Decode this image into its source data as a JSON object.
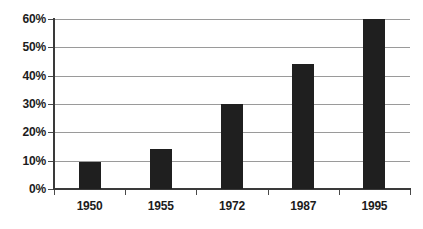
{
  "chart_data": {
    "type": "bar",
    "title": "",
    "xlabel": "",
    "ylabel": "",
    "categories": [
      "1950",
      "1955",
      "1972",
      "1987",
      "1995"
    ],
    "values": [
      9.5,
      14,
      30,
      44,
      60
    ],
    "ylim": [
      0,
      60
    ],
    "ytick_values": [
      0,
      10,
      20,
      30,
      40,
      50,
      60
    ],
    "ytick_labels": [
      "0%",
      "10%",
      "20%",
      "30%",
      "40%",
      "50%",
      "60%"
    ],
    "grid": true,
    "legend": false,
    "series": [
      {
        "name": "",
        "values": [
          9.5,
          14,
          30,
          44,
          60
        ]
      }
    ],
    "colors": {
      "bar": "#1f1f1f",
      "gridline": "#9a9a9a",
      "axis": "#3a3a3a",
      "text": "#1c1c1c",
      "background": "#ffffff"
    }
  }
}
